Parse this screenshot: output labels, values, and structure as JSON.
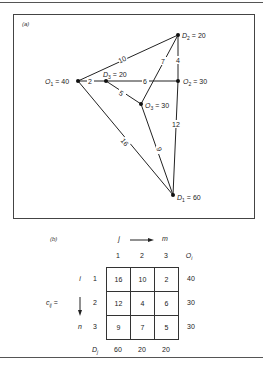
{
  "panel_a": {
    "label": "(a)",
    "nodes": [
      {
        "id": "O1",
        "letter": "O",
        "sub": "1",
        "value": "= 40"
      },
      {
        "id": "D3",
        "letter": "D",
        "sub": "3",
        "value": "= 20"
      },
      {
        "id": "O2",
        "letter": "O",
        "sub": "2",
        "value": "= 30"
      },
      {
        "id": "D2",
        "letter": "D",
        "sub": "2",
        "value": "= 20"
      },
      {
        "id": "O3",
        "letter": "O",
        "sub": "3",
        "value": "= 30"
      },
      {
        "id": "D1",
        "letter": "D",
        "sub": "1",
        "value": "= 60"
      }
    ],
    "edges": [
      {
        "from": "O1",
        "to": "D3",
        "cost": "2"
      },
      {
        "from": "O1",
        "to": "D2",
        "cost": "10"
      },
      {
        "from": "O1",
        "to": "D1",
        "cost": "16"
      },
      {
        "from": "D3",
        "to": "O2",
        "cost": "6"
      },
      {
        "from": "D3",
        "to": "O3",
        "cost": "5"
      },
      {
        "from": "O3",
        "to": "D2",
        "cost": "7"
      },
      {
        "from": "D2",
        "to": "O2",
        "cost": "4"
      },
      {
        "from": "O2",
        "to": "D1",
        "cost": "12"
      },
      {
        "from": "O3",
        "to": "D1",
        "cost": "9"
      }
    ]
  },
  "panel_b": {
    "label": "(b)",
    "col_index_start": "j",
    "col_index_end": "m",
    "row_index_start": "i",
    "row_index_end": "n",
    "matrix_label": "c",
    "matrix_sub": "ij",
    "matrix_eq": "=",
    "col_headers": [
      "1",
      "2",
      "3"
    ],
    "origin_header": "O",
    "origin_header_sub": "i",
    "row_headers": [
      "1",
      "2",
      "3"
    ],
    "cells": [
      [
        "16",
        "10",
        "2"
      ],
      [
        "12",
        "4",
        "6"
      ],
      [
        "9",
        "7",
        "5"
      ]
    ],
    "origins": [
      "40",
      "30",
      "30"
    ],
    "dest_label": "D",
    "dest_label_sub": "j",
    "destinations": [
      "60",
      "20",
      "20"
    ]
  }
}
